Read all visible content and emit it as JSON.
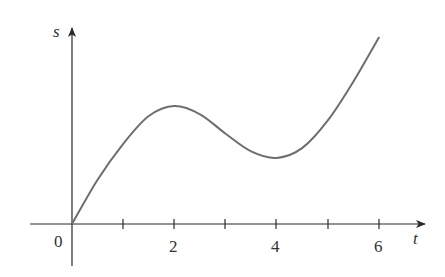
{
  "chart_data": {
    "type": "line",
    "title": "",
    "xlabel": "t",
    "ylabel": "s",
    "x_ticks": [
      1,
      2,
      3,
      4,
      5,
      6
    ],
    "x_tick_labels": [
      "0",
      "2",
      "4",
      "6"
    ],
    "y_ticks": [],
    "xlim": [
      -0.8,
      6.9
    ],
    "ylim": [
      -7,
      33
    ],
    "grid": false,
    "legend": null,
    "series": [
      {
        "name": "s(t)",
        "x": [
          0,
          0.5,
          1,
          1.5,
          2,
          2.5,
          3,
          3.5,
          4,
          4.5,
          5,
          5.5,
          6
        ],
        "values": [
          0,
          7.5,
          13.6,
          18.3,
          20,
          18.6,
          15.3,
          12.3,
          11.2,
          12.9,
          17.6,
          24.2,
          31.7
        ]
      }
    ],
    "annotations": [
      "local maximum near t = 2",
      "local minimum near t = 4"
    ]
  },
  "axes": {
    "x_label": "t",
    "y_label": "s",
    "origin_label": "0",
    "tick_labels": [
      {
        "t": 2,
        "text": "2"
      },
      {
        "t": 4,
        "text": "4"
      },
      {
        "t": 6,
        "text": "6"
      }
    ]
  }
}
